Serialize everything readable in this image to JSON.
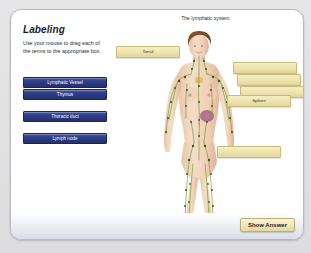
{
  "panel": {
    "title": "Labeling",
    "instructions": "Use your mouse to drag each of the terms to the appropriate box.",
    "accent_blue": "#2d3f88",
    "accent_yellow": "#ece3ae",
    "background": "#ffffff"
  },
  "terms": [
    {
      "label": "Lymphatic Vessel",
      "x": 12,
      "y": 67
    },
    {
      "label": "Thymus",
      "x": 12,
      "y": 79
    },
    {
      "label": "Thoracic duct",
      "x": 12,
      "y": 101
    },
    {
      "label": "Lymph node",
      "x": 12,
      "y": 123
    }
  ],
  "illustration": {
    "title": "The lymphatic system.",
    "subject": "female-anatomical-figure",
    "vessel_color": "#6f9b3f",
    "node_color": "#3f5a1f",
    "skin_color": "#f0d3bc"
  },
  "label_boxes": [
    {
      "name": "tonsil-box",
      "label": "Tonsil",
      "x": 105,
      "y": 36,
      "w": 62,
      "h": 10,
      "filled": true
    },
    {
      "name": "answer-box-1",
      "label": "",
      "x": 222,
      "y": 52,
      "w": 62,
      "h": 10,
      "filled": false
    },
    {
      "name": "answer-box-2",
      "label": "",
      "x": 226,
      "y": 64,
      "w": 62,
      "h": 10,
      "filled": false
    },
    {
      "name": "answer-box-3",
      "label": "",
      "x": 229,
      "y": 76,
      "w": 62,
      "h": 10,
      "filled": false
    },
    {
      "name": "spleen-box",
      "label": "Spleen",
      "x": 216,
      "y": 85,
      "w": 62,
      "h": 10,
      "filled": true
    },
    {
      "name": "answer-box-4",
      "label": "",
      "x": 206,
      "y": 136,
      "w": 62,
      "h": 10,
      "filled": false
    }
  ],
  "actions": {
    "show_answer": "Show Answer"
  }
}
